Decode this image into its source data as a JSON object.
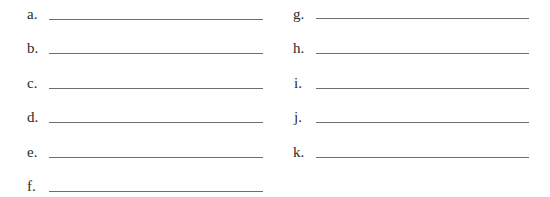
{
  "worksheet": {
    "left_column": [
      {
        "label": "a.",
        "value": ""
      },
      {
        "label": "b.",
        "value": ""
      },
      {
        "label": "c.",
        "value": ""
      },
      {
        "label": "d.",
        "value": ""
      },
      {
        "label": "e.",
        "value": ""
      },
      {
        "label": "f.",
        "value": ""
      }
    ],
    "right_column": [
      {
        "label": "g.",
        "value": ""
      },
      {
        "label": "h.",
        "value": ""
      },
      {
        "label": "i.",
        "value": ""
      },
      {
        "label": "j.",
        "value": ""
      },
      {
        "label": "k.",
        "value": ""
      }
    ],
    "line_color": "#6e6e6e"
  }
}
